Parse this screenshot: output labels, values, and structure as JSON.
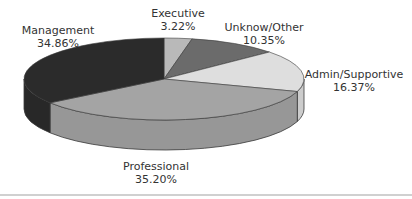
{
  "chart_data": {
    "type": "pie",
    "style": "3d",
    "title": "",
    "slices": [
      {
        "label": "Executive",
        "value": 3.22,
        "display": "3.22%",
        "color": "#b9b9b9"
      },
      {
        "label": "Unknow/Other",
        "value": 10.35,
        "display": "10.35%",
        "color": "#6b6b6b"
      },
      {
        "label": "Admin/Supportive",
        "value": 16.37,
        "display": "16.37%",
        "color": "#dedede"
      },
      {
        "label": "Professional",
        "value": 35.2,
        "display": "35.20%",
        "color": "#a4a4a4"
      },
      {
        "label": "Management",
        "value": 34.86,
        "display": "34.86%",
        "color": "#2b2b2b"
      }
    ],
    "start_angle": "top",
    "direction": "clockwise",
    "legend": "none"
  },
  "labels": {
    "executive": {
      "name": "Executive",
      "pct": "3.22%"
    },
    "unknown": {
      "name": "Unknow/Other",
      "pct": "10.35%"
    },
    "admin": {
      "name": "Admin/Supportive",
      "pct": "16.37%"
    },
    "professional": {
      "name": "Professional",
      "pct": "35.20%"
    },
    "management": {
      "name": "Management",
      "pct": "34.86%"
    }
  }
}
